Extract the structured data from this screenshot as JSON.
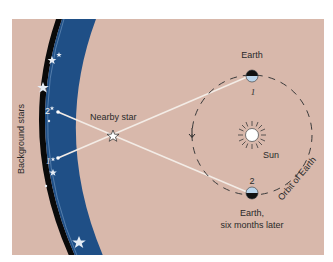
{
  "diagram": {
    "colors": {
      "background": "#d8b8ab",
      "band_blue": "#1f4f86",
      "band_edge": "#0a0a0a",
      "sight_line": "#f3ece6",
      "orbit": "#3a3a3a",
      "earth_light": "#b9d4ea",
      "earth_dark": "#111111",
      "sun": "#ffffff"
    },
    "labels": {
      "background_stars": "Background stars",
      "nearby_star": "Nearby star",
      "earth_top": "Earth",
      "earth_bottom_line1": "Earth,",
      "earth_bottom_line2": "six months later",
      "sun": "Sun",
      "orbit": "Orbit of Earth",
      "pos1_earth": "1",
      "pos2_earth": "2",
      "pos1_background": "1",
      "pos2_background": "2"
    },
    "nodes": [
      {
        "id": "earth-1",
        "label": "Earth",
        "position": "1"
      },
      {
        "id": "earth-2",
        "label": "Earth, six months later",
        "position": "2"
      },
      {
        "id": "sun",
        "label": "Sun"
      },
      {
        "id": "nearby-star",
        "label": "Nearby star"
      },
      {
        "id": "bg-point-1",
        "label": "1"
      },
      {
        "id": "bg-point-2",
        "label": "2"
      }
    ],
    "edges": [
      {
        "from": "earth-1",
        "to": "bg-point-1",
        "via": "nearby-star"
      },
      {
        "from": "earth-2",
        "to": "bg-point-2",
        "via": "nearby-star"
      }
    ]
  }
}
